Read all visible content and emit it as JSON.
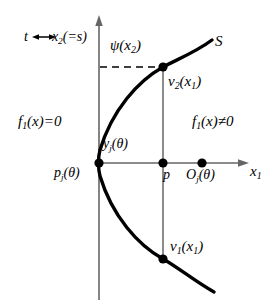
{
  "figure": {
    "title": "",
    "colors": {
      "ink": "#000000",
      "background": "#ffffff",
      "thin_line": "#555555"
    },
    "labels": {
      "param_identification": "t ↔ x",
      "param_identification_sub": "2",
      "param_identification_tail": "(=s)",
      "psi_fn": "ψ(x",
      "psi_fn_sub": "2",
      "psi_fn_tail": ")",
      "surface": "S",
      "upper_branch": "v",
      "upper_branch_sub": "2",
      "upper_branch_tail": "(x",
      "upper_branch_sub2": "1",
      "upper_branch_tail2": ")",
      "lower_branch": "v",
      "lower_branch_sub": "1",
      "lower_branch_tail": "(x",
      "lower_branch_sub2": "1",
      "lower_branch_tail2": ")",
      "region_left": "f",
      "region_left_sub": "1",
      "region_left_tail": "(x)=0",
      "region_right": "f",
      "region_right_sub": "1",
      "region_right_tail": "(x)≠0",
      "tangency_point": "y",
      "tangency_point_sub": "j",
      "tangency_point_tail": "(θ)",
      "origin_point": "p",
      "origin_point_sub": "j",
      "origin_point_tail": "(θ)",
      "interior_point": "p",
      "outer_point": "O",
      "outer_point_sub": "j",
      "outer_point_tail": "(θ)",
      "axis_x": "x",
      "axis_x_sub": "1"
    },
    "geometry": {
      "vertical_axis_x": 99,
      "horizontal_axis_y": 163,
      "vertical_axis_top_y": 18,
      "vertical_axis_bottom_y": 300,
      "horizontal_axis_right_x": 247,
      "parabola_vertex": [
        99,
        163
      ],
      "point_pj": [
        99,
        163
      ],
      "point_p": [
        163,
        163
      ],
      "point_Oj": [
        202,
        163
      ],
      "point_v2": [
        163,
        67
      ],
      "point_v1": [
        163,
        259
      ],
      "dashed_level_y": 67,
      "curve_upper_end": [
        212,
        40
      ],
      "curve_lower_end": [
        214,
        292
      ],
      "chord_x": 163
    }
  }
}
